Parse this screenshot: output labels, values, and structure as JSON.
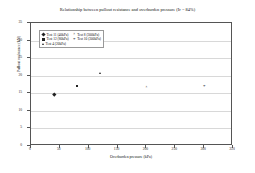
{
  "chart_data": {
    "type": "scatter",
    "title": "Relationship between pullout resistance and overburden pressure (Ir = 84%)",
    "xlabel": "Overburden pressure (kPa)",
    "ylabel": "Pullout resistance (kN)",
    "xlim": [
      0,
      350
    ],
    "ylim": [
      0,
      35
    ],
    "xticks": [
      "0",
      "50",
      "100",
      "150",
      "200",
      "250",
      "300",
      "350"
    ],
    "yticks": [
      "0",
      "5",
      "10",
      "15",
      "20",
      "25",
      "30",
      "35"
    ],
    "grid": "horizontal",
    "legend_position": "upper-left-inside",
    "series": [
      {
        "name": "Test 11 (40kPa)",
        "marker": "diamond",
        "points": [
          {
            "x": 40,
            "y": 14.8
          }
        ]
      },
      {
        "name": "Test 12 (80kPa)",
        "marker": "square",
        "points": [
          {
            "x": 80,
            "y": 17.1
          }
        ]
      },
      {
        "name": "Test 4 (20kPa)",
        "marker": "triangle",
        "points": [
          {
            "x": 120,
            "y": 20.6
          }
        ]
      },
      {
        "name": "Test 8 (300kPa)",
        "marker": "cross",
        "points": [
          {
            "x": 200,
            "y": 16.8
          }
        ]
      },
      {
        "name": "Test 10 (300kPa)",
        "marker": "star",
        "points": [
          {
            "x": 300,
            "y": 16.9
          }
        ]
      }
    ]
  }
}
